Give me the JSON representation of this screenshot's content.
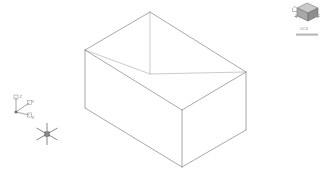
{
  "app": {
    "name": "CAD Viewport",
    "background_color": "#ffffff",
    "geometry_color": "#8c8c8c",
    "hidden_edge_color": "#b4b4b4",
    "ui_gray": "#9a9a9a"
  },
  "viewport": {
    "name": "model-space-viewport",
    "view_style": "Wireframe",
    "view_direction": "SE Isometric",
    "width": 321,
    "height": 176
  },
  "model": {
    "name": "3D box solid",
    "type": "box",
    "edge_count": 12,
    "vertices": {
      "top_back": {
        "x": 150,
        "y": 12
      },
      "top_left": {
        "x": 85,
        "y": 50
      },
      "top_right": {
        "x": 246,
        "y": 72
      },
      "top_front": {
        "x": 182,
        "y": 110
      },
      "bottom_left": {
        "x": 85,
        "y": 108
      },
      "bottom_right": {
        "x": 246,
        "y": 130
      },
      "bottom_front": {
        "x": 182,
        "y": 167
      },
      "bottom_back": {
        "x": 150,
        "y": 74
      }
    }
  },
  "ucs_icon": {
    "name": "ucs-axis-tripod",
    "origin": {
      "x": 16,
      "y": 112
    },
    "axes": [
      {
        "label": "Z",
        "label_x": 19,
        "label_y": 97,
        "tip_x": 16,
        "tip_y": 99
      },
      {
        "label": "Y",
        "label_x": 31,
        "label_y": 101,
        "tip_x": 29,
        "tip_y": 103
      },
      {
        "label": "X",
        "label_x": 31,
        "label_y": 118,
        "tip_x": 29,
        "tip_y": 114
      }
    ]
  },
  "cursor": {
    "name": "isometric-crosshair-cursor",
    "x": 47,
    "y": 134,
    "arm_length": 11,
    "pickbox_size": 4
  },
  "view_cube": {
    "name": "view-cube",
    "x": 296,
    "y": 3,
    "size": 22,
    "compass_label": "",
    "menu_label": "UCS",
    "menu_x": 300,
    "menu_y": 29
  }
}
